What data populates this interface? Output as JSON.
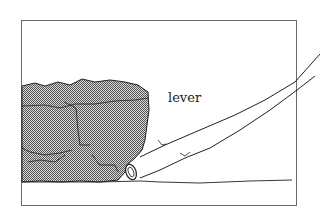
{
  "diagram": {
    "labels": {
      "lever": "lever"
    },
    "elements": [
      "rock",
      "lever",
      "fulcrum",
      "ground",
      "frame"
    ],
    "colors": {
      "line": "#222222",
      "rock_fill": "#9a9a9a",
      "frame": "#6a6a6a",
      "background": "#ffffff"
    }
  }
}
